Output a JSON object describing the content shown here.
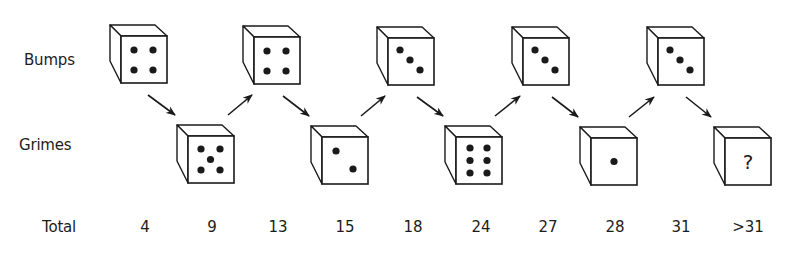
{
  "labels": {
    "bumps": "Bumps",
    "grimes": "Grimes",
    "total": "Total"
  },
  "colors": {
    "ink": "#1a1a1a",
    "background": "#ffffff"
  },
  "dice": [
    {
      "player": "Bumps",
      "value": 4,
      "face": "4",
      "x": 110,
      "y": 25,
      "total": "4"
    },
    {
      "player": "Grimes",
      "value": 5,
      "face": "5",
      "x": 177,
      "y": 125,
      "total": "9"
    },
    {
      "player": "Bumps",
      "value": 4,
      "face": "4",
      "x": 243,
      "y": 26,
      "total": "13"
    },
    {
      "player": "Grimes",
      "value": 2,
      "face": "2",
      "x": 311,
      "y": 126,
      "total": "15"
    },
    {
      "player": "Bumps",
      "value": 3,
      "face": "3",
      "x": 377,
      "y": 27,
      "total": "18"
    },
    {
      "player": "Grimes",
      "value": 6,
      "face": "6",
      "x": 445,
      "y": 126,
      "total": "24"
    },
    {
      "player": "Bumps",
      "value": 3,
      "face": "3",
      "x": 512,
      "y": 27,
      "total": "27"
    },
    {
      "player": "Grimes",
      "value": 1,
      "face": "1",
      "x": 580,
      "y": 127,
      "total": "28"
    },
    {
      "player": "Bumps",
      "value": 3,
      "face": "3",
      "x": 647,
      "y": 27,
      "total": "31"
    },
    {
      "player": "Grimes",
      "value": null,
      "face": "?",
      "x": 714,
      "y": 127,
      "total": ">31"
    }
  ],
  "totals": [
    "4",
    "9",
    "13",
    "15",
    "18",
    "24",
    "27",
    "28",
    "31",
    ">31"
  ],
  "total_x": [
    145,
    212,
    278,
    345,
    413,
    481,
    548,
    615,
    681,
    748
  ],
  "arrows": [
    {
      "from": [
        148,
        95
      ],
      "to": [
        175,
        115
      ],
      "direction": "down-right"
    },
    {
      "from": [
        228,
        115
      ],
      "to": [
        252,
        95
      ],
      "direction": "up-right"
    },
    {
      "from": [
        283,
        96
      ],
      "to": [
        309,
        116
      ],
      "direction": "down-right"
    },
    {
      "from": [
        361,
        116
      ],
      "to": [
        385,
        96
      ],
      "direction": "up-right"
    },
    {
      "from": [
        417,
        97
      ],
      "to": [
        443,
        116
      ],
      "direction": "down-right"
    },
    {
      "from": [
        495,
        116
      ],
      "to": [
        520,
        96
      ],
      "direction": "up-right"
    },
    {
      "from": [
        552,
        97
      ],
      "to": [
        578,
        117
      ],
      "direction": "down-right"
    },
    {
      "from": [
        629,
        117
      ],
      "to": [
        654,
        97
      ],
      "direction": "up-right"
    },
    {
      "from": [
        686,
        97
      ],
      "to": [
        711,
        117
      ],
      "direction": "down-right"
    }
  ]
}
